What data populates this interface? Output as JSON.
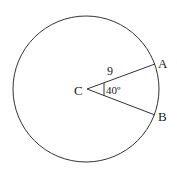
{
  "diagram": {
    "type": "circle-sector",
    "center_label": "C",
    "point_a_label": "A",
    "point_b_label": "B",
    "radius_label": "9",
    "angle_label": "40º",
    "colors": {
      "stroke": "#333333",
      "background": "#ffffff"
    }
  }
}
